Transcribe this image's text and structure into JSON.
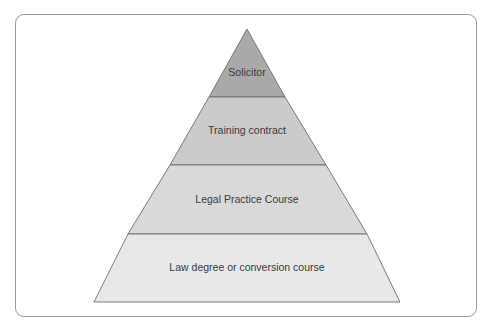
{
  "diagram": {
    "type": "pyramid",
    "title": "",
    "orientation": "apex-up",
    "levels_top_to_bottom": [
      {
        "label": "Solicitor",
        "fill": "#a9a9a9"
      },
      {
        "label": "Training contract",
        "fill": "#cbcbcb"
      },
      {
        "label": "Legal Practice Course",
        "fill": "#d9d9d9"
      },
      {
        "label": "Law degree or conversion course",
        "fill": "#e8e8e8"
      }
    ],
    "stroke_color": "#6e6e6e",
    "frame_border_color": "#9a9a9a"
  }
}
